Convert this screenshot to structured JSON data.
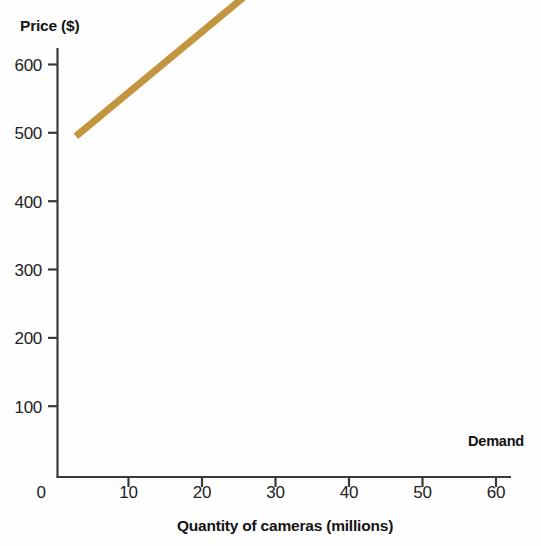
{
  "chart_data": {
    "type": "line",
    "title": "",
    "xlabel": "Quantity of cameras (millions)",
    "ylabel": "Price ($)",
    "xlim": [
      0,
      62
    ],
    "ylim": [
      0,
      630
    ],
    "grid": false,
    "legend_position": "inline-right-end",
    "background_color": "#fefefe",
    "axis_color": "#3a3a3a",
    "series": [
      {
        "name": "Demand",
        "color": "#c4953f",
        "line_width": 7,
        "label_text": "Demand",
        "x": [
          2.5,
          55.6
        ],
        "y": [
          505,
          32
        ],
        "points": [
          {
            "x": 2.5,
            "y": 505
          },
          {
            "x": 10,
            "y": 438
          },
          {
            "x": 20,
            "y": 349
          },
          {
            "x": 30,
            "y": 260
          },
          {
            "x": 40,
            "y": 171
          },
          {
            "x": 50,
            "y": 82
          },
          {
            "x": 55.6,
            "y": 32
          }
        ]
      }
    ],
    "x_ticks": [
      {
        "value": 0,
        "label": "0"
      },
      {
        "value": 10,
        "label": "10"
      },
      {
        "value": 20,
        "label": "20"
      },
      {
        "value": 30,
        "label": "30"
      },
      {
        "value": 40,
        "label": "40"
      },
      {
        "value": 50,
        "label": "50"
      },
      {
        "value": 60,
        "label": "60"
      }
    ],
    "y_ticks": [
      {
        "value": 100,
        "label": "100"
      },
      {
        "value": 200,
        "label": "200"
      },
      {
        "value": 300,
        "label": "300"
      },
      {
        "value": 400,
        "label": "400"
      },
      {
        "value": 500,
        "label": "500"
      },
      {
        "value": 600,
        "label": "600"
      }
    ]
  },
  "labels": {
    "y_axis_title": "Price ($)",
    "x_axis_title": "Quantity of cameras (millions)",
    "origin_label": "0",
    "demand_label": "Demand",
    "y_tick_600": "600",
    "y_tick_500": "500",
    "y_tick_400": "400",
    "y_tick_300": "300",
    "y_tick_200": "200",
    "y_tick_100": "100",
    "x_tick_10": "10",
    "x_tick_20": "20",
    "x_tick_30": "30",
    "x_tick_40": "40",
    "x_tick_50": "50",
    "x_tick_60": "60"
  }
}
